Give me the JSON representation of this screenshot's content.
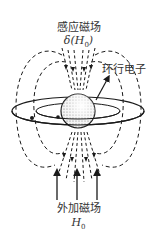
{
  "labels": {
    "induced_field": "感应磁场",
    "induced_field_symbol_prefix": "δ(H",
    "induced_field_symbol_sub": "0",
    "induced_field_symbol_suffix": ")",
    "circulating_electron": "环行电子",
    "external_field": "外加磁场",
    "external_field_symbol": "H",
    "external_field_symbol_sub": "0"
  },
  "colors": {
    "line": "#1a1a1a",
    "nucleus_fill": "#d9d9d9",
    "background": "#ffffff"
  },
  "elements": {
    "nucleus": "sphere",
    "electron_orbits": 2,
    "external_field_arrows": 3,
    "induced_field_lines": "dashed"
  }
}
